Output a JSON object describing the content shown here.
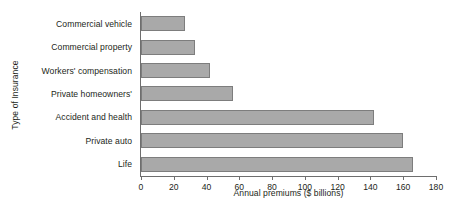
{
  "chart_data": {
    "type": "bar",
    "orientation": "horizontal",
    "title": "",
    "xlabel": "Annual premiums ($ billions)",
    "ylabel": "Type of Insurance",
    "categories": [
      "Commercial vehicle",
      "Commercial property",
      "Workers' compensation",
      "Private homeowners'",
      "Accident and health",
      "Private auto",
      "Life"
    ],
    "values": [
      27,
      33,
      42,
      56,
      142,
      160,
      166
    ],
    "xlim": [
      0,
      180
    ],
    "xticks": [
      0,
      20,
      40,
      60,
      80,
      100,
      120,
      140,
      160,
      180
    ],
    "xtick_labels": [
      "0",
      "20",
      "40",
      "60",
      "80",
      "100",
      "120",
      "140",
      "160",
      "180"
    ],
    "grid": false,
    "legend": null,
    "bar_color": "#a9a9a9",
    "bar_border_color": "#7d7d7d",
    "axis_color": "#6e6e6e",
    "background_color": "#ffffff"
  }
}
